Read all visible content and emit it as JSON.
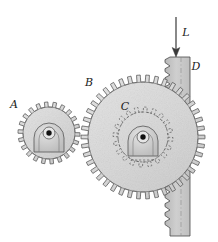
{
  "figure": {
    "background_color": "#ffffff",
    "width": 218,
    "height": 242
  },
  "labels": {
    "gear_a": "A",
    "gear_b": "B",
    "gear_c": "C",
    "rack_d": "D",
    "load_l": "L"
  },
  "colors": {
    "body_fill": "#d9d9d9",
    "hub_fill": "#c9c9c9",
    "outline": "#4a4a4a",
    "hidden_line": "#5a5a5a",
    "rack_fill": "#c4c4c4",
    "shaft_fill": "#111111",
    "label_color": "#1a1a1a"
  },
  "components": [
    {
      "name": "gear-a",
      "label": "A",
      "type": "spur-gear",
      "center_x": 49,
      "center_y": 133,
      "outer_radius": 31,
      "root_radius": 26,
      "teeth": 22,
      "visible": "solid"
    },
    {
      "name": "gear-b",
      "label": "B",
      "type": "spur-gear",
      "center_x": 143,
      "center_y": 137,
      "outer_radius": 62,
      "root_radius": 55,
      "teeth": 42,
      "visible": "solid"
    },
    {
      "name": "gear-c",
      "label": "C",
      "type": "spur-gear",
      "center_x": 143,
      "center_y": 137,
      "outer_radius": 30,
      "root_radius": 25,
      "teeth": 20,
      "visible": "hidden-dashed"
    },
    {
      "name": "rack-d",
      "label": "D",
      "type": "rack",
      "left_x": 170,
      "right_x": 190,
      "top_y": 57,
      "bottom_y": 236,
      "tooth_pitch": 9,
      "tooth_depth": 5,
      "visible": "solid"
    },
    {
      "name": "load-arrow-l",
      "label": "L",
      "type": "force-arrow",
      "direction": "down",
      "x": 176,
      "start_y": 18,
      "end_y": 55
    }
  ],
  "label_positions": {
    "gear_a": {
      "x": 17,
      "y": 107
    },
    "gear_b": {
      "x": 88,
      "y": 86
    },
    "gear_c": {
      "x": 124,
      "y": 110
    },
    "rack_d": {
      "x": 194,
      "y": 70
    },
    "load_l": {
      "x": 184,
      "y": 35
    }
  }
}
